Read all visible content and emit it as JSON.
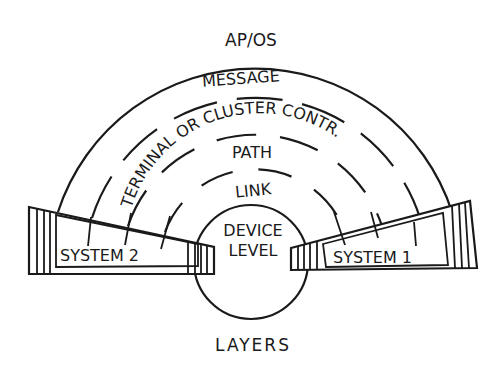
{
  "title": "LAYERS",
  "layers": [
    {
      "name": "ap-os",
      "label": "AP/OS"
    },
    {
      "name": "message",
      "label": "MESSAGE"
    },
    {
      "name": "terminal-or-cluster",
      "label": "TERMINAL OR CLUSTER CONTR."
    },
    {
      "name": "path",
      "label": "PATH"
    },
    {
      "name": "link",
      "label": "LINK"
    },
    {
      "name": "device-level",
      "label_line1": "DEVICE",
      "label_line2": "LEVEL"
    }
  ],
  "systems": [
    {
      "name": "system-2",
      "label": "SYSTEM 2"
    },
    {
      "name": "system-1",
      "label": "SYSTEM 1"
    }
  ],
  "colors": {
    "ink": "#1a1a1a",
    "background": "#ffffff"
  }
}
